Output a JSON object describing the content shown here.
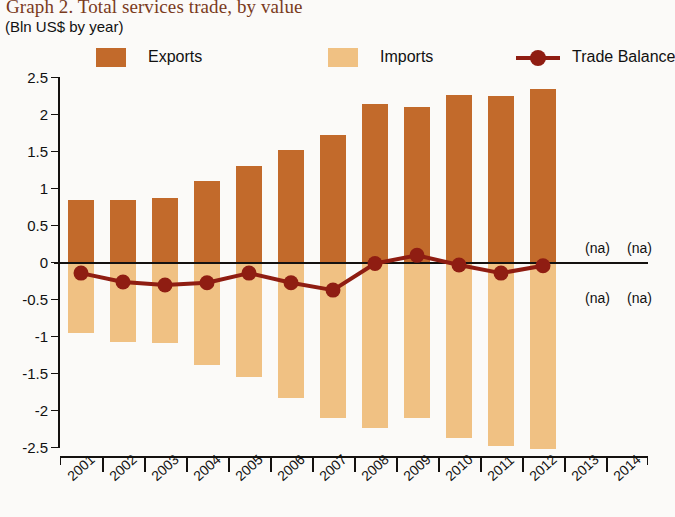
{
  "title": "Graph 2. Total services trade, by value",
  "subtitle": "(Bln US$ by year)",
  "legend": [
    {
      "name": "exports",
      "label": "Exports",
      "color": "#C26A2B",
      "type": "swatch"
    },
    {
      "name": "imports",
      "label": "Imports",
      "color": "#F0C183",
      "type": "swatch"
    },
    {
      "name": "trade-balance",
      "label": "Trade Balance",
      "color": "#8F1D12",
      "type": "line-marker"
    }
  ],
  "na_labels": [
    {
      "text": "(na)",
      "x": 525,
      "y": 178
    },
    {
      "text": "(na)",
      "x": 567,
      "y": 178
    },
    {
      "text": "(na)",
      "x": 525,
      "y": 228
    },
    {
      "text": "(na)",
      "x": 567,
      "y": 228
    }
  ],
  "chart_data": {
    "type": "bar",
    "title": "Graph 2. Total services trade, by value",
    "subtitle": "(Bln US$ by year)",
    "xlabel": "",
    "ylabel": "Bln US$",
    "ylim": [
      -2.5,
      2.5
    ],
    "yticks": [
      2.5,
      2,
      1.5,
      1,
      0.5,
      0,
      -0.5,
      -1,
      -1.5,
      -2,
      -2.5
    ],
    "ytick_labels": [
      "2.5",
      "2",
      "1.5",
      "1",
      "0.5",
      "0",
      "-0.5",
      "-1",
      "-1.5",
      "-2",
      "-2.5"
    ],
    "grid": false,
    "legend_position": "top",
    "categories": [
      "2001",
      "2002",
      "2003",
      "2004",
      "2005",
      "2006",
      "2007",
      "2008",
      "2009",
      "2010",
      "2011",
      "2012",
      "2013",
      "2014"
    ],
    "series": [
      {
        "name": "Exports",
        "color": "#C26A2B",
        "type": "bar",
        "values": [
          0.84,
          0.84,
          0.86,
          1.09,
          1.3,
          1.52,
          1.72,
          2.14,
          2.1,
          2.26,
          2.25,
          2.34,
          null,
          null
        ]
      },
      {
        "name": "Imports",
        "color": "#F0C183",
        "type": "bar",
        "values": [
          -0.96,
          -1.08,
          -1.1,
          -1.39,
          -1.55,
          -1.84,
          -2.11,
          -2.24,
          -2.11,
          -2.38,
          -2.49,
          -2.53,
          null,
          null
        ]
      },
      {
        "name": "Trade Balance",
        "color": "#8F1D12",
        "type": "line",
        "values": [
          -0.15,
          -0.27,
          -0.31,
          -0.28,
          -0.15,
          -0.28,
          -0.38,
          -0.02,
          0.09,
          -0.04,
          -0.15,
          -0.05,
          null,
          null
        ]
      }
    ]
  }
}
